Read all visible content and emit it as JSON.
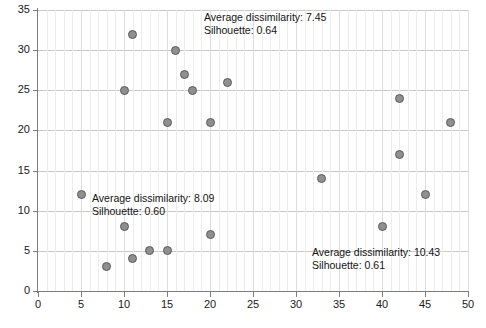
{
  "chart_data": {
    "type": "scatter",
    "title": "",
    "xlabel": "",
    "ylabel": "",
    "xlim": [
      0,
      50
    ],
    "ylim": [
      0,
      35
    ],
    "xticks": [
      0,
      5,
      10,
      15,
      20,
      25,
      30,
      35,
      40,
      45,
      50
    ],
    "yticks": [
      0,
      5,
      10,
      15,
      20,
      25,
      30,
      35
    ],
    "grid": true,
    "legend": null,
    "marker": {
      "shape": "circle",
      "fill": "#8f8f8f",
      "edge": "#5a5a5a",
      "size_px": 9
    },
    "points": [
      {
        "x": 5,
        "y": 12
      },
      {
        "x": 8,
        "y": 3
      },
      {
        "x": 10,
        "y": 8
      },
      {
        "x": 10,
        "y": 25
      },
      {
        "x": 11,
        "y": 4
      },
      {
        "x": 11,
        "y": 32
      },
      {
        "x": 13,
        "y": 5
      },
      {
        "x": 15,
        "y": 5
      },
      {
        "x": 15,
        "y": 21
      },
      {
        "x": 16,
        "y": 30
      },
      {
        "x": 17,
        "y": 27
      },
      {
        "x": 18,
        "y": 25
      },
      {
        "x": 20,
        "y": 7
      },
      {
        "x": 20,
        "y": 21
      },
      {
        "x": 22,
        "y": 26
      },
      {
        "x": 33,
        "y": 14
      },
      {
        "x": 40,
        "y": 8
      },
      {
        "x": 42,
        "y": 24
      },
      {
        "x": 42,
        "y": 17
      },
      {
        "x": 45,
        "y": 12
      },
      {
        "x": 48,
        "y": 21
      }
    ],
    "annotations": [
      {
        "id": "cluster-1",
        "line1": "Average dissimilarity: 7.45",
        "line2": "Silhouette: 0.64",
        "x_px": 204,
        "y_px": 11
      },
      {
        "id": "cluster-2",
        "line1": "Average dissimilarity: 8.09",
        "line2": "Silhouette: 0.60",
        "x_px": 92,
        "y_px": 192
      },
      {
        "id": "cluster-3",
        "line1": "Average dissimilarity: 10.43",
        "line2": "Silhouette: 0.61",
        "x_px": 312,
        "y_px": 246
      }
    ]
  }
}
